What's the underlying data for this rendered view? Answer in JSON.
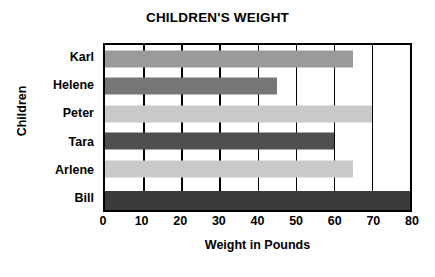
{
  "chart_data": {
    "type": "bar",
    "orientation": "horizontal",
    "title": "CHILDREN'S WEIGHT",
    "xlabel": "Weight in Pounds",
    "ylabel": "Children",
    "categories": [
      "Karl",
      "Helene",
      "Peter",
      "Tara",
      "Arlene",
      "Bill"
    ],
    "values": [
      65,
      45,
      70,
      60,
      65,
      80
    ],
    "bar_colors": [
      "#9a9a9a",
      "#767676",
      "#c9c9c9",
      "#4f4f4f",
      "#c9c9c9",
      "#3b3b3b"
    ],
    "xlim": [
      0,
      80
    ],
    "xticks": [
      0,
      10,
      20,
      30,
      40,
      50,
      60,
      70,
      80
    ],
    "xtick_labels": [
      "0",
      "10",
      "20",
      "30",
      "40",
      "50",
      "60",
      "70",
      "80"
    ],
    "grid": "vertical",
    "grid_color": "#000000",
    "legend": null,
    "plot_border_color": "#000000",
    "background": "#ffffff"
  }
}
